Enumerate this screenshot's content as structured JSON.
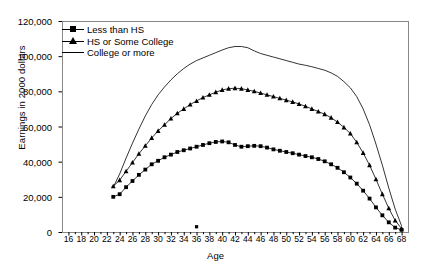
{
  "chart_data": {
    "type": "line",
    "title": "",
    "xlabel": "Age",
    "ylabel": "Earnings in 2000 dollars",
    "xlim": [
      15,
      69
    ],
    "ylim": [
      0,
      120000
    ],
    "grid": false,
    "legend_position": "top-left-inside",
    "ytick_labels": [
      "0",
      "20,000",
      "40,000",
      "60,000",
      "80,000",
      "100,000",
      "120,000"
    ],
    "ytick_values": [
      0,
      20000,
      40000,
      60000,
      80000,
      100000,
      120000
    ],
    "xtick_labels": [
      "16",
      "18",
      "20",
      "22",
      "24",
      "26",
      "28",
      "30",
      "32",
      "34",
      "36",
      "38",
      "40",
      "42",
      "44",
      "46",
      "48",
      "50",
      "52",
      "54",
      "56",
      "58",
      "60",
      "62",
      "64",
      "66",
      "68"
    ],
    "xtick_values": [
      16,
      18,
      20,
      22,
      24,
      26,
      28,
      30,
      32,
      34,
      36,
      38,
      40,
      42,
      44,
      46,
      48,
      50,
      52,
      54,
      56,
      58,
      60,
      62,
      64,
      66,
      68
    ],
    "x": [
      23,
      24,
      25,
      26,
      27,
      28,
      29,
      30,
      31,
      32,
      33,
      34,
      35,
      36,
      37,
      38,
      39,
      40,
      41,
      42,
      43,
      44,
      45,
      46,
      47,
      48,
      49,
      50,
      51,
      52,
      53,
      54,
      55,
      56,
      57,
      58,
      59,
      60,
      61,
      62,
      63,
      64,
      65,
      66,
      67,
      68
    ],
    "series": [
      {
        "name": "Less than HS",
        "marker": "square",
        "values": [
          20000,
          21500,
          25500,
          29000,
          32500,
          35500,
          38500,
          40500,
          42500,
          44000,
          45500,
          46500,
          47500,
          48500,
          49500,
          50500,
          51200,
          51500,
          51000,
          49500,
          48500,
          48800,
          49000,
          48800,
          48000,
          47000,
          46200,
          45500,
          44800,
          44000,
          43200,
          42500,
          41500,
          40200,
          38500,
          36500,
          34000,
          31000,
          27500,
          23500,
          19000,
          14000,
          9500,
          5500,
          2500,
          1200
        ]
      },
      {
        "name": "HS or Some College",
        "marker": "triangle",
        "values": [
          26000,
          29500,
          34500,
          39500,
          44500,
          49000,
          53500,
          57500,
          61000,
          64500,
          67500,
          70000,
          72500,
          74500,
          76500,
          78000,
          79500,
          80800,
          81500,
          81800,
          81500,
          80800,
          80000,
          79000,
          78000,
          77000,
          76000,
          75000,
          74000,
          72800,
          71500,
          70000,
          68500,
          67000,
          65000,
          62500,
          59500,
          56000,
          51000,
          45000,
          38000,
          30000,
          21500,
          13500,
          6500,
          2000
        ]
      },
      {
        "name": "College or more",
        "marker": "none",
        "values": [
          25500,
          33000,
          42000,
          50500,
          58500,
          66000,
          72500,
          78000,
          82500,
          86500,
          90000,
          93000,
          95500,
          97500,
          99000,
          100500,
          102000,
          103500,
          104800,
          105500,
          105500,
          104800,
          103000,
          101500,
          100500,
          99500,
          98500,
          97500,
          96500,
          95500,
          94800,
          94000,
          93000,
          92000,
          90500,
          88500,
          85500,
          82000,
          77000,
          70000,
          61000,
          50000,
          38000,
          25000,
          13000,
          3500
        ]
      }
    ],
    "stray_marker": {
      "x": 36,
      "y": 3000
    }
  }
}
